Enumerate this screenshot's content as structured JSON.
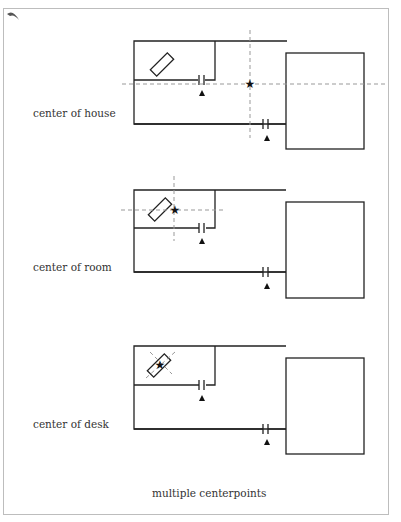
{
  "diagrams": [
    {
      "label": "center of house"
    },
    {
      "label": "center of room"
    },
    {
      "label": "center of desk"
    }
  ],
  "caption": "multiple centerpoints",
  "colors": {
    "line": "#222222",
    "guide": "#999999",
    "frame": "#bdbdbd"
  }
}
